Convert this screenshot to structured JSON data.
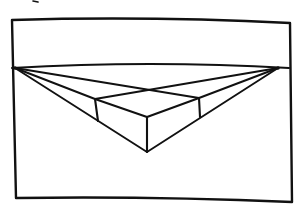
{
  "drawing": {
    "subject": "two-point perspective box sketch",
    "ink_color": "#111111",
    "paper_color": "#ffffff",
    "frame": {
      "corners": [
        [
          12,
          20
        ],
        [
          290,
          23
        ],
        [
          292,
          202
        ],
        [
          16,
          198
        ]
      ]
    },
    "horizon_line": {
      "from": [
        12,
        68
      ],
      "to": [
        289,
        68
      ],
      "bow": 6
    },
    "vanishing_points": {
      "left": [
        15,
        68
      ],
      "right": [
        278,
        68
      ]
    },
    "box": {
      "far_top_corner": [
        145,
        90
      ],
      "left_top_corner": [
        95,
        99
      ],
      "right_top_corner": [
        199,
        98
      ],
      "front_top_corner": [
        147,
        117
      ],
      "left_bottom_corner": [
        98,
        121
      ],
      "right_bottom_corner": [
        200,
        117
      ],
      "front_bottom_corner": [
        147,
        152
      ]
    },
    "cropped_mark": [
      35,
      2
    ]
  }
}
